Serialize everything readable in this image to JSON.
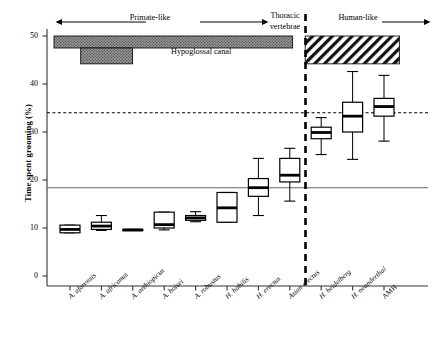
{
  "figure": {
    "ylabel": "Time spent grooming (%)",
    "yticks": [
      "0",
      "10",
      "20",
      "30",
      "40",
      "50"
    ],
    "annotations": {
      "primate_like": "Primate-like",
      "human_like": "Human-like",
      "thoracic_line1": "Thoracic",
      "thoracic_line2": "vertebrae",
      "hypoglossal": "Hypoglossal canal"
    }
  },
  "chart_data": {
    "type": "box",
    "title": "",
    "xlabel": "",
    "ylabel": "Time spent grooming (%)",
    "ylim": [
      0,
      52
    ],
    "yticks": [
      0,
      10,
      20,
      30,
      40,
      50
    ],
    "grid": false,
    "legend": null,
    "categories": [
      "A. afarensis",
      "A. africanus",
      "A. aethiopicus",
      "A. boisei",
      "A. robustus",
      "H. habilis",
      "H. erectus",
      "Asian erectus",
      "H. heidelbergensis",
      "H. neanderthal",
      "AMH"
    ],
    "category_labels": [
      "A. afarensis",
      "A. africanus",
      "A. aethiopicus",
      "A. boisei",
      "A. robustus",
      "H. habilis",
      "H. erectus",
      "Asian erectus",
      "H. heidelberg",
      "H. neanderthal",
      "AMH"
    ],
    "boxes": [
      {
        "name": "A. afarensis",
        "whisker_low": 9.0,
        "q1": 9.0,
        "median": 9.7,
        "q3": 10.6,
        "whisker_high": 10.6
      },
      {
        "name": "A. africanus",
        "whisker_low": 9.5,
        "q1": 9.7,
        "median": 10.4,
        "q3": 11.2,
        "whisker_high": 12.6
      },
      {
        "name": "A. aethiopicus",
        "whisker_low": 9.5,
        "q1": 9.5,
        "median": 9.6,
        "q3": 9.7,
        "whisker_high": 9.7
      },
      {
        "name": "A. boisei",
        "whisker_low": 9.6,
        "q1": 10.0,
        "median": 10.7,
        "q3": 13.3,
        "whisker_high": 13.3
      },
      {
        "name": "A. robustus",
        "whisker_low": 11.3,
        "q1": 11.6,
        "median": 12.1,
        "q3": 12.6,
        "whisker_high": 13.4
      },
      {
        "name": "H. habilis",
        "whisker_low": 11.2,
        "q1": 11.2,
        "median": 14.2,
        "q3": 17.4,
        "whisker_high": 17.4
      },
      {
        "name": "H. erectus",
        "whisker_low": 12.6,
        "q1": 16.6,
        "median": 18.4,
        "q3": 20.3,
        "whisker_high": 24.5
      },
      {
        "name": "Asian erectus",
        "whisker_low": 15.6,
        "q1": 19.6,
        "median": 21.0,
        "q3": 24.5,
        "whisker_high": 26.6
      },
      {
        "name": "H. heidelbergensis",
        "whisker_low": 25.3,
        "q1": 28.6,
        "median": 29.9,
        "q3": 31.0,
        "whisker_high": 33.0
      },
      {
        "name": "H. neanderthal",
        "whisker_low": 24.3,
        "q1": 30.0,
        "median": 33.3,
        "q3": 36.2,
        "whisker_high": 42.6
      },
      {
        "name": "AMH",
        "whisker_low": 28.1,
        "q1": 33.3,
        "median": 35.3,
        "q3": 37.0,
        "whisker_high": 41.8
      }
    ],
    "reference_lines": [
      {
        "name": "solid-reference-line",
        "value": 18.4,
        "style": "solid",
        "color": "#666666"
      },
      {
        "name": "dotted-reference-line",
        "value": 34.0,
        "style": "dotted",
        "color": "#000000"
      }
    ],
    "divider": {
      "name": "group-divider",
      "after_category_index": 7,
      "style": "dashed",
      "color": "#000000"
    },
    "bands": [
      {
        "name": "hypoglossal-canal-band-primate",
        "label": "Hypoglossal canal",
        "fill": "dotted-grey",
        "y_top": 50.0,
        "y_bottom": 47.5,
        "x_start_cat": 0,
        "x_end_cat": 7.6
      },
      {
        "name": "hypoglossal-canal-band-stub",
        "label": "",
        "fill": "dotted-grey",
        "y_top": 47.5,
        "y_bottom": 44.2,
        "x_start_cat": 0.85,
        "x_end_cat": 2.5
      },
      {
        "name": "hypoglossal-canal-band-human",
        "label": "",
        "fill": "diagonal-hatch",
        "y_top": 50.0,
        "y_bottom": 44.2,
        "x_start_cat": 8.0,
        "x_end_cat": 11.0
      }
    ],
    "arrows": [
      {
        "name": "primate-like-arrow",
        "label": "Primate-like",
        "direction": "both"
      },
      {
        "name": "human-like-arrow",
        "label": "Human-like",
        "direction": "right"
      }
    ]
  }
}
